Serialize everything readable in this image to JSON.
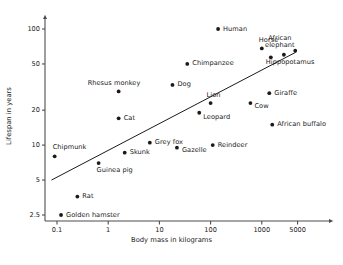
{
  "chart_data": {
    "type": "scatter",
    "title": "",
    "xlabel": "Body mass in kilograms",
    "ylabel": "Lifespan in years",
    "xscale": "log",
    "yscale": "log",
    "grid": false,
    "legend": null,
    "xticks": [
      "0.1",
      "1",
      "10",
      "100",
      "1000",
      "5000"
    ],
    "xtick_values": [
      0.1,
      1,
      10,
      100,
      1000,
      5000
    ],
    "yticks": [
      "2.5",
      "5",
      "10",
      "20",
      "50",
      "100"
    ],
    "ytick_values": [
      2.5,
      5,
      10,
      20,
      50,
      100
    ],
    "xlim": [
      0.07,
      8000
    ],
    "ylim": [
      2.3,
      115
    ],
    "points": [
      {
        "name": "Golden hamster",
        "x": 0.12,
        "y": 2.5,
        "label_dx": 5,
        "label_dy": -3.5,
        "align": "left"
      },
      {
        "name": "Rat",
        "x": 0.25,
        "y": 3.6,
        "label_dx": 5,
        "label_dy": -3.5,
        "align": "left"
      },
      {
        "name": "Chipmunk",
        "x": 0.09,
        "y": 8.0,
        "label_dx": -2,
        "label_dy": -12,
        "align": "left"
      },
      {
        "name": "Guinea pig",
        "x": 0.65,
        "y": 7.0,
        "label_dx": -2,
        "label_dy": 4,
        "align": "left"
      },
      {
        "name": "Rhesus monkey",
        "x": 1.6,
        "y": 29,
        "label_dx": -31,
        "label_dy": -11,
        "align": "left"
      },
      {
        "name": "Cat",
        "x": 1.6,
        "y": 17,
        "label_dx": 5,
        "label_dy": -3.5,
        "align": "left"
      },
      {
        "name": "Skunk",
        "x": 2.1,
        "y": 8.6,
        "label_dx": 5,
        "label_dy": -3.5,
        "align": "left"
      },
      {
        "name": "Grey fox",
        "x": 6.5,
        "y": 10.5,
        "label_dx": 5,
        "label_dy": -3.5,
        "align": "left"
      },
      {
        "name": "Dog",
        "x": 18,
        "y": 33,
        "label_dx": 5,
        "label_dy": -3.5,
        "align": "left"
      },
      {
        "name": "Gazelle",
        "x": 22,
        "y": 9.5,
        "label_dx": 5,
        "label_dy": -0.5,
        "align": "left"
      },
      {
        "name": "Chimpanzee",
        "x": 35,
        "y": 50,
        "label_dx": 5,
        "label_dy": -3.5,
        "align": "left"
      },
      {
        "name": "Leopard",
        "x": 60,
        "y": 19,
        "label_dx": 4,
        "label_dy": 1,
        "align": "left"
      },
      {
        "name": "Lion",
        "x": 100,
        "y": 23,
        "label_dx": -4,
        "label_dy": -11,
        "align": "left"
      },
      {
        "name": "Reindeer",
        "x": 110,
        "y": 10,
        "label_dx": 5,
        "label_dy": -3.5,
        "align": "left"
      },
      {
        "name": "Human",
        "x": 140,
        "y": 100,
        "label_dx": 5,
        "label_dy": -3.5,
        "align": "left"
      },
      {
        "name": "Cow",
        "x": 600,
        "y": 23,
        "label_dx": 4,
        "label_dy": -0.5,
        "align": "left"
      },
      {
        "name": "Horse",
        "x": 1000,
        "y": 68,
        "label_dx": -3,
        "label_dy": -11,
        "align": "left"
      },
      {
        "name": "Giraffe",
        "x": 1400,
        "y": 28,
        "label_dx": 5,
        "label_dy": -3.5,
        "align": "left"
      },
      {
        "name": "Hippopotamus",
        "x": 1500,
        "y": 57,
        "label_dx": -5,
        "label_dy": 2,
        "align": "left"
      },
      {
        "name": "African buffalo",
        "x": 1600,
        "y": 15,
        "label_dx": 5,
        "label_dy": -3.5,
        "align": "left"
      },
      {
        "name": "African elephant",
        "x": 2700,
        "y": 60,
        "label_dx": -4,
        "label_dy": -20,
        "align": "left",
        "two_line": true
      },
      {
        "name": "African elephant 2",
        "x": 4500,
        "y": 65,
        "label_dx": 0,
        "label_dy": 0,
        "align": "none",
        "hide_label": true
      }
    ],
    "trendline": {
      "x_start": 0.078,
      "y_start": 5.0,
      "x_end": 4600,
      "y_end": 63,
      "description": "allometric best-fit line"
    },
    "colors": {
      "axis": "#4d4d4d",
      "point": "#1a1a1a",
      "text": "#1a1a1a",
      "trendline": "#1a1a1a",
      "background": "#ffffff"
    }
  }
}
